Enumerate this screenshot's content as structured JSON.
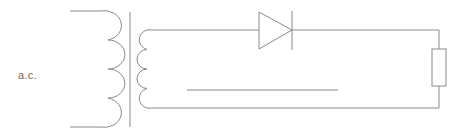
{
  "diagram": {
    "type": "circuit",
    "labels": {
      "source": "a.c."
    },
    "components": [
      {
        "name": "transformer",
        "primary_turns": 4,
        "secondary_turns": 4
      },
      {
        "name": "diode",
        "orientation": "forward-right"
      },
      {
        "name": "resistor",
        "orientation": "vertical"
      },
      {
        "name": "reference-line"
      }
    ],
    "colors": {
      "stroke": "#8a8a8a",
      "text": "#6a6a6a",
      "background": "#ffffff"
    }
  }
}
